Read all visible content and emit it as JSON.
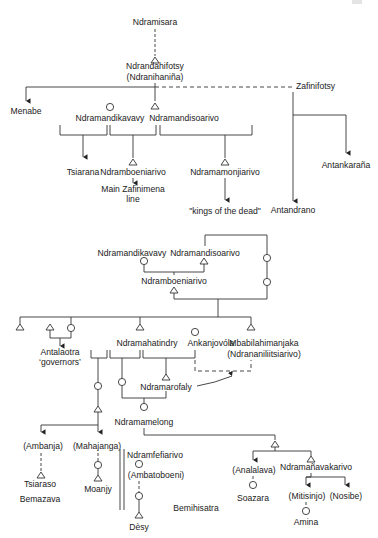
{
  "figure": {
    "legend_note": "Genealogy diagram: triangles = male, circles = female, dashed lines = indirect descent, arrows = descendant groups",
    "top_tree": {
      "root": "Ndramisara",
      "founder": "Ndrandahifotsy",
      "founder_alt": "(Ndranihaniña)",
      "branch_left": "Menabe",
      "branch_right": "Zafinifotsy",
      "zafinifotsy_children": [
        "Antankaraña",
        "Antandrano"
      ],
      "children": [
        "Ndramandikavavy",
        "Ndramandisoarivo"
      ],
      "grandchildren": [
        "Tsiarana",
        "Ndramboeniarivo",
        "Ndramamonjiarivo"
      ],
      "main_line": [
        "Main Zafinimena",
        "line"
      ],
      "kings_of_dead": "\"kings of the dead\""
    },
    "bottom_tree": {
      "parents": [
        "Ndramandikavavy",
        "Ndramandisoarivo"
      ],
      "son": "Ndramboeniarivo",
      "antalaotra": [
        "Antalaotra",
        "‘governors’"
      ],
      "gen2": [
        "Ndramahatindry",
        "Ankanjovóla",
        "Mbabilahimanjaka",
        "(Ndrananiliitsiarivo)"
      ],
      "ndramarofaly": "Ndramarofaly",
      "ndramamelong": "Ndramamelong",
      "places_left": [
        "(Ambanja)",
        "(Mahajanga)"
      ],
      "tsiaraso": "Tsiaraso",
      "moanjy": "Moanjy",
      "bemazava": "Bemazava",
      "ndramfefiarivo": "Ndramfefiarivo",
      "ambatoboeni": "(Ambatoboeni)",
      "desy": "Dèsy",
      "bemihisatra": "Bemihisatra",
      "analalava": "(Analalava)",
      "soazara": "Soazara",
      "ndramanavakarivo": "Ndramañavakarivo",
      "mitisinjo": "(Mitisinjo)",
      "nosibe": "(Nosibe)",
      "amina": "Amina"
    }
  },
  "colors": {
    "line": "#333333",
    "text": "#222222",
    "background": "#ffffff"
  }
}
